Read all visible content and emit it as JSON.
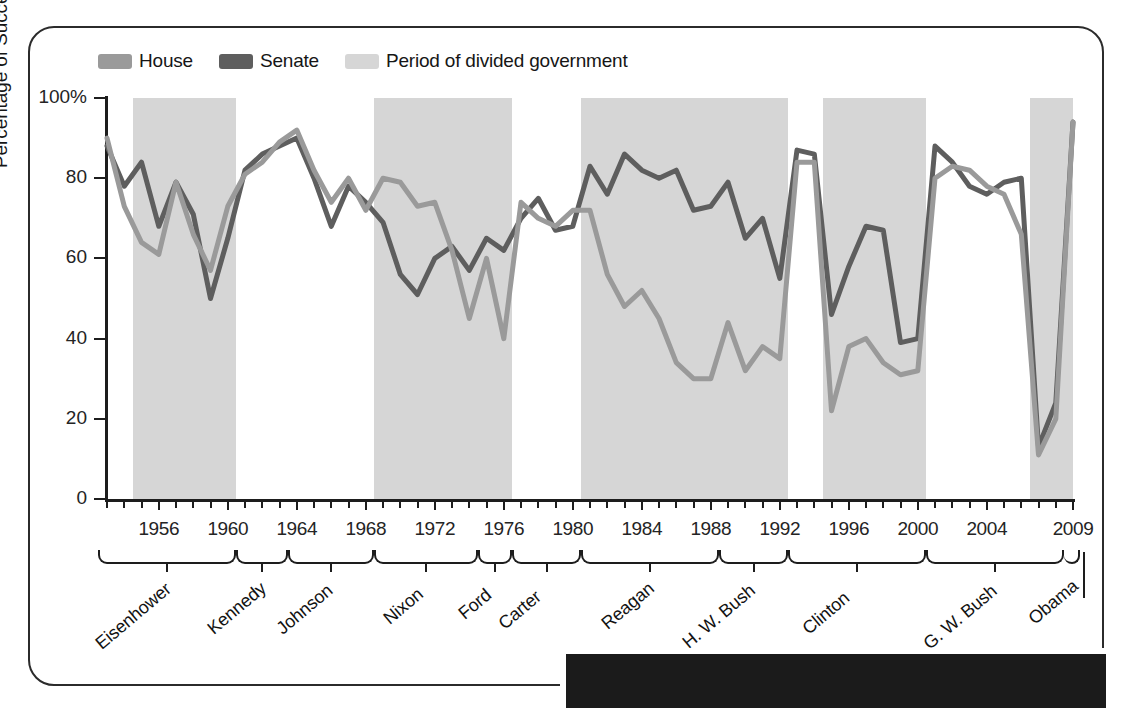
{
  "legend": {
    "items": [
      {
        "label": "House",
        "color": "#9a9a9a"
      },
      {
        "label": "Senate",
        "color": "#5e5e5e"
      },
      {
        "label": "Period of divided government",
        "color": "#d6d6d6"
      }
    ]
  },
  "axes": {
    "y_title": "Percentage of Successful Votes",
    "y_ticks": [
      "0",
      "20",
      "40",
      "60",
      "80",
      "100%"
    ],
    "x_ticks": [
      "1956",
      "1960",
      "1964",
      "1968",
      "1972",
      "1976",
      "1980",
      "1984",
      "1988",
      "1992",
      "1996",
      "2000",
      "2004",
      "2009"
    ]
  },
  "presidents": [
    {
      "name": "Eisenhower",
      "start": 1953,
      "end": 1960
    },
    {
      "name": "Kennedy",
      "start": 1961,
      "end": 1963
    },
    {
      "name": "Johnson",
      "start": 1964,
      "end": 1968
    },
    {
      "name": "Nixon",
      "start": 1969,
      "end": 1974
    },
    {
      "name": "Ford",
      "start": 1975,
      "end": 1976
    },
    {
      "name": "Carter",
      "start": 1977,
      "end": 1980
    },
    {
      "name": "Reagan",
      "start": 1981,
      "end": 1988
    },
    {
      "name": "G. H. W. Bush",
      "start": 1989,
      "end": 1992
    },
    {
      "name": "Clinton",
      "start": 1993,
      "end": 2000
    },
    {
      "name": "G. W. Bush",
      "start": 2001,
      "end": 2008
    },
    {
      "name": "Obama",
      "start": 2009,
      "end": 2009
    }
  ],
  "chart_data": {
    "type": "line",
    "title": "",
    "xlabel": "",
    "ylabel": "Percentage of Successful Votes",
    "xlim": [
      1953,
      2009
    ],
    "ylim": [
      0,
      100
    ],
    "grid": false,
    "legend_position": "top-left",
    "x": [
      1953,
      1954,
      1955,
      1956,
      1957,
      1958,
      1959,
      1960,
      1961,
      1962,
      1963,
      1964,
      1965,
      1966,
      1967,
      1968,
      1969,
      1970,
      1971,
      1972,
      1973,
      1974,
      1975,
      1976,
      1977,
      1978,
      1979,
      1980,
      1981,
      1982,
      1983,
      1984,
      1985,
      1986,
      1987,
      1988,
      1989,
      1990,
      1991,
      1992,
      1993,
      1994,
      1995,
      1996,
      1997,
      1998,
      1999,
      2000,
      2001,
      2002,
      2003,
      2004,
      2005,
      2006,
      2007,
      2008,
      2009
    ],
    "series": [
      {
        "name": "House",
        "color": "#9a9a9a",
        "values": [
          90,
          73,
          64,
          61,
          79,
          66,
          57,
          73,
          81,
          84,
          89,
          92,
          82,
          74,
          80,
          72,
          80,
          79,
          73,
          74,
          62,
          45,
          60,
          40,
          74,
          70,
          68,
          72,
          72,
          56,
          48,
          52,
          45,
          34,
          30,
          30,
          44,
          32,
          38,
          35,
          84,
          84,
          22,
          38,
          40,
          34,
          31,
          32,
          80,
          83,
          82,
          78,
          76,
          66,
          11,
          20,
          94
        ]
      },
      {
        "name": "Senate",
        "color": "#5e5e5e",
        "values": [
          88,
          78,
          84,
          68,
          79,
          71,
          50,
          65,
          82,
          86,
          88,
          90,
          80,
          68,
          78,
          74,
          69,
          56,
          51,
          60,
          63,
          57,
          65,
          62,
          70,
          75,
          67,
          68,
          83,
          76,
          86,
          82,
          80,
          82,
          72,
          73,
          79,
          65,
          70,
          55,
          87,
          86,
          46,
          58,
          68,
          67,
          39,
          40,
          88,
          84,
          78,
          76,
          79,
          80,
          13,
          24,
          94
        ]
      }
    ],
    "divided_government_bands": [
      {
        "start": 1955,
        "end": 1960
      },
      {
        "start": 1969,
        "end": 1976
      },
      {
        "start": 1981,
        "end": 1992
      },
      {
        "start": 1995,
        "end": 2000
      },
      {
        "start": 2007,
        "end": 2009
      }
    ]
  }
}
